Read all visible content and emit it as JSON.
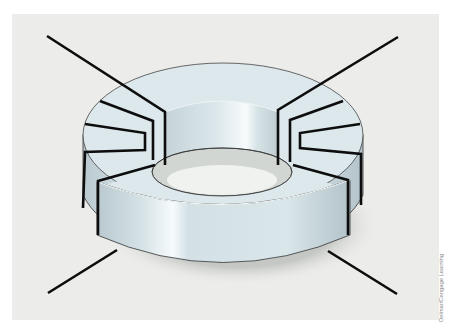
{
  "figure": {
    "credit": "Delmar/Cengage Learning",
    "colors": {
      "panel_background": "#ececea",
      "core_top": "#dde9ec",
      "core_side": "#cfdde2",
      "core_highlight": "#f4f9fa",
      "shadow": "#c9ccc8",
      "wire": "#0d0d0d",
      "outline": "#333333"
    },
    "windings": [
      {
        "name": "left-winding",
        "turns": 4,
        "leads": [
          "top-left",
          "bottom-left"
        ]
      },
      {
        "name": "right-winding",
        "turns": 4,
        "leads": [
          "top-right",
          "bottom-right"
        ]
      }
    ]
  }
}
